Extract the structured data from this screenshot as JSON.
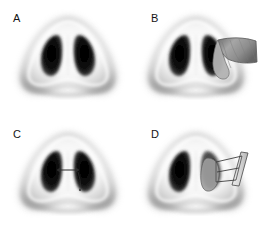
{
  "figure": {
    "background_color": "#ffffff",
    "layout": {
      "rows": 2,
      "columns": 2,
      "panel_width": 137,
      "panel_height": 115
    },
    "panels": [
      {
        "id": "a",
        "label": "A",
        "caption": "Basal view of nose, baseline anatomy",
        "illustration": "nose-basal-view",
        "overlay": "none"
      },
      {
        "id": "b",
        "label": "B",
        "caption": "Basal view with triangular cartilage graft elevated at right nostril rim",
        "illustration": "nose-basal-view",
        "overlay": "triangular-graft-flap"
      },
      {
        "id": "c",
        "label": "C",
        "caption": "Basal view with horizontal suture arrow marker across the septum",
        "illustration": "nose-basal-view",
        "overlay": "suture-arrow-marker"
      },
      {
        "id": "d",
        "label": "D",
        "caption": "Basal view with rectangular strut graft sutured to right nostril",
        "illustration": "nose-basal-view",
        "overlay": "rectangular-strut-graft-with-sutures"
      }
    ],
    "colors": {
      "background": "#ffffff",
      "label_text": "#141414",
      "skin_light": "#fbfbfb",
      "skin_mid": "#c9c9c9",
      "skin_shadow": "#8a8a8a",
      "nostril_dark": "#0d0d0d",
      "graft_fill": "#9a9a9a",
      "graft_outline": "#5a5a5a",
      "suture_line": "#3a3a3a"
    }
  }
}
